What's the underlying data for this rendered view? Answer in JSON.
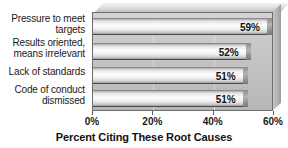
{
  "chart_data": {
    "type": "bar",
    "orientation": "horizontal",
    "title": "",
    "xlabel": "Percent Citing These Root Causes",
    "ylabel": "",
    "xlim": [
      0,
      60
    ],
    "xticks": [
      0,
      20,
      40,
      60
    ],
    "xtick_labels": [
      "0%",
      "20%",
      "40%",
      "60%"
    ],
    "grid": true,
    "legend": false,
    "categories": [
      "Pressure to meet targets",
      "Results oriented, means irrelevant",
      "Lack of standards",
      "Code of conduct dismissed"
    ],
    "category_lines": [
      [
        "Pressure to meet",
        "targets"
      ],
      [
        "Results oriented,",
        "means irrelevant"
      ],
      [
        "Lack of standards"
      ],
      [
        "Code of conduct",
        "dismissed"
      ]
    ],
    "values": [
      59,
      52,
      51,
      51
    ],
    "data_labels": [
      "59%",
      "52%",
      "51%",
      "51%"
    ],
    "colors": {
      "bar_fill_light": "#fdfdfd",
      "bar_fill_shadow": "#9a9a9a",
      "plot_background": "#c4c4c4",
      "frame_border": "#6e6e6e",
      "text": "#111111",
      "gridline": "#e2e2e2"
    }
  }
}
